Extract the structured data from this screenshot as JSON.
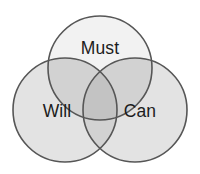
{
  "diagram": {
    "type": "venn",
    "title": "",
    "set_count": 3,
    "canvas": {
      "width": 200,
      "height": 174,
      "background": "#ffffff"
    },
    "style": {
      "stroke_color": "#565656",
      "stroke_width": 1.6,
      "fill_top": "#f2f2f2",
      "fill_left": "#e3e3e3",
      "fill_right": "#e3e3e3",
      "fill_overlap_pair": "#d2d2d2",
      "fill_overlap_center": "#c3c3c3",
      "label_color": "#1c1c1c",
      "label_font_size": 17.5
    },
    "sets": [
      {
        "id": "must",
        "label": "Must",
        "cx": 100,
        "cy": 68,
        "r": 52,
        "label_x": 100,
        "label_y": 49,
        "fill": "#f2f2f2"
      },
      {
        "id": "will",
        "label": "Will",
        "cx": 65,
        "cy": 110,
        "r": 52,
        "label_x": 57,
        "label_y": 112,
        "fill": "#e3e3e3"
      },
      {
        "id": "can",
        "label": "Can",
        "cx": 135,
        "cy": 110,
        "r": 52,
        "label_x": 140,
        "label_y": 112,
        "fill": "#e3e3e3"
      }
    ],
    "intersections": [
      {
        "id": "must-will",
        "sets": [
          "must",
          "will"
        ],
        "label": "",
        "fill": "#d2d2d2"
      },
      {
        "id": "must-can",
        "sets": [
          "must",
          "can"
        ],
        "label": "",
        "fill": "#d2d2d2"
      },
      {
        "id": "will-can",
        "sets": [
          "will",
          "can"
        ],
        "label": "",
        "fill": "#d2d2d2"
      },
      {
        "id": "must-will-can",
        "sets": [
          "must",
          "will",
          "can"
        ],
        "label": "",
        "fill": "#c3c3c3"
      }
    ]
  }
}
